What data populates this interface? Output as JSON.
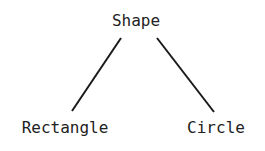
{
  "diagram": {
    "type": "tree",
    "root": {
      "label": "Shape"
    },
    "children": [
      {
        "label": "Rectangle"
      },
      {
        "label": "Circle"
      }
    ],
    "edges": [
      {
        "from": "Shape",
        "to": "Rectangle"
      },
      {
        "from": "Shape",
        "to": "Circle"
      }
    ]
  }
}
